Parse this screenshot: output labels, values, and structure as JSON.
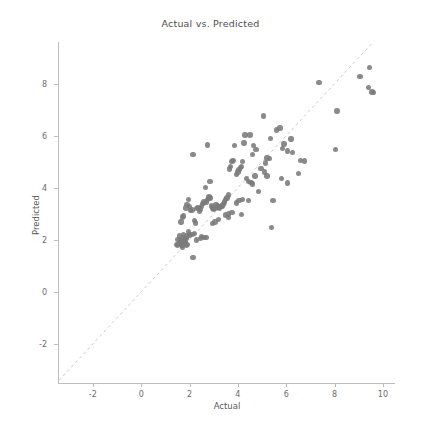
{
  "chart_data": {
    "type": "scatter",
    "title": "Actual vs. Predicted",
    "xlabel": "Actual",
    "ylabel": "Predicted",
    "xlim": [
      -3.4,
      10.5
    ],
    "ylim": [
      -3.5,
      9.6
    ],
    "grid": false,
    "legend": null,
    "marker_color": "#7a7a7a",
    "reference_line": {
      "name": "identity-line",
      "style": "dashed",
      "color": "#cccccc",
      "from": [
        -3.4,
        -3.4
      ],
      "to": [
        9.6,
        9.6
      ]
    },
    "xticks": [
      -2,
      0,
      2,
      4,
      6,
      8,
      10
    ],
    "yticks": [
      -2,
      0,
      2,
      4,
      6,
      8
    ],
    "xticklabels": [
      "-2",
      "0",
      "2",
      "4",
      "6",
      "8",
      "10"
    ],
    "yticklabels": [
      "-2",
      "0",
      "2",
      "4",
      "6",
      "8"
    ],
    "points": [
      [
        9.45,
        8.63
      ],
      [
        9.05,
        8.27
      ],
      [
        9.4,
        7.85
      ],
      [
        9.55,
        7.68
      ],
      [
        9.6,
        7.66
      ],
      [
        7.35,
        8.05
      ],
      [
        8.1,
        6.95
      ],
      [
        8.05,
        5.47
      ],
      [
        6.75,
        5.03
      ],
      [
        6.6,
        5.05
      ],
      [
        6.5,
        4.55
      ],
      [
        6.2,
        5.88
      ],
      [
        6.25,
        5.35
      ],
      [
        6.05,
        5.42
      ],
      [
        6.05,
        4.18
      ],
      [
        5.9,
        5.68
      ],
      [
        5.85,
        5.52
      ],
      [
        5.8,
        4.35
      ],
      [
        5.75,
        6.3
      ],
      [
        5.6,
        6.22
      ],
      [
        5.35,
        5.9
      ],
      [
        5.3,
        5.12
      ],
      [
        5.2,
        5.15
      ],
      [
        5.15,
        4.95
      ],
      [
        5.05,
        6.75
      ],
      [
        5.45,
        3.5
      ],
      [
        5.4,
        2.47
      ],
      [
        5.2,
        4.45
      ],
      [
        5.1,
        4.6
      ],
      [
        4.95,
        4.75
      ],
      [
        4.75,
        5.48
      ],
      [
        4.65,
        5.62
      ],
      [
        4.6,
        5.28
      ],
      [
        4.5,
        6.03
      ],
      [
        4.3,
        6.03
      ],
      [
        4.25,
        5.72
      ],
      [
        4.2,
        5.0
      ],
      [
        4.15,
        4.82
      ],
      [
        4.1,
        4.78
      ],
      [
        4.05,
        4.7
      ],
      [
        4.0,
        4.6
      ],
      [
        3.95,
        4.52
      ],
      [
        4.35,
        4.35
      ],
      [
        4.45,
        4.25
      ],
      [
        4.55,
        4.2
      ],
      [
        4.6,
        4.15
      ],
      [
        4.7,
        4.45
      ],
      [
        4.85,
        3.85
      ],
      [
        4.45,
        3.5
      ],
      [
        4.2,
        3.55
      ],
      [
        4.05,
        3.5
      ],
      [
        4.15,
        2.98
      ],
      [
        3.95,
        3.42
      ],
      [
        3.85,
        5.62
      ],
      [
        3.8,
        5.05
      ],
      [
        3.75,
        5.0
      ],
      [
        3.7,
        4.82
      ],
      [
        3.65,
        4.72
      ],
      [
        3.6,
        3.72
      ],
      [
        3.55,
        3.6
      ],
      [
        3.5,
        3.55
      ],
      [
        3.45,
        3.45
      ],
      [
        3.4,
        3.38
      ],
      [
        3.35,
        3.3
      ],
      [
        3.3,
        3.28
      ],
      [
        3.25,
        3.22
      ],
      [
        3.2,
        3.25
      ],
      [
        3.15,
        3.3
      ],
      [
        3.1,
        3.35
      ],
      [
        3.05,
        3.2
      ],
      [
        3.0,
        3.18
      ],
      [
        2.95,
        3.22
      ],
      [
        2.9,
        3.3
      ],
      [
        2.85,
        3.6
      ],
      [
        2.8,
        3.65
      ],
      [
        2.75,
        3.55
      ],
      [
        2.7,
        3.45
      ],
      [
        2.95,
        2.62
      ],
      [
        3.05,
        2.68
      ],
      [
        3.2,
        2.78
      ],
      [
        3.5,
        2.95
      ],
      [
        3.6,
        3.0
      ],
      [
        3.75,
        3.05
      ],
      [
        3.6,
        2.85
      ],
      [
        2.85,
        4.25
      ],
      [
        2.75,
        5.65
      ],
      [
        2.65,
        4.0
      ],
      [
        2.6,
        3.45
      ],
      [
        2.55,
        3.4
      ],
      [
        2.5,
        3.28
      ],
      [
        2.45,
        3.18
      ],
      [
        2.4,
        3.1
      ],
      [
        2.35,
        3.25
      ],
      [
        2.3,
        3.2
      ],
      [
        2.25,
        2.65
      ],
      [
        2.2,
        2.75
      ],
      [
        2.15,
        5.28
      ],
      [
        2.1,
        3.15
      ],
      [
        2.05,
        3.12
      ],
      [
        2.0,
        3.28
      ],
      [
        1.95,
        3.55
      ],
      [
        1.9,
        3.35
      ],
      [
        1.85,
        3.22
      ],
      [
        1.75,
        2.92
      ],
      [
        1.7,
        2.88
      ],
      [
        1.65,
        2.68
      ],
      [
        2.15,
        1.32
      ],
      [
        2.3,
        2.0
      ],
      [
        2.45,
        2.05
      ],
      [
        2.5,
        2.12
      ],
      [
        2.6,
        2.1
      ],
      [
        2.7,
        2.08
      ],
      [
        2.2,
        2.25
      ],
      [
        2.1,
        2.2
      ],
      [
        2.0,
        2.18
      ],
      [
        1.95,
        2.32
      ],
      [
        1.9,
        2.15
      ],
      [
        1.85,
        2.05
      ],
      [
        1.8,
        2.02
      ],
      [
        1.75,
        2.2
      ],
      [
        1.7,
        2.1
      ],
      [
        1.65,
        1.98
      ],
      [
        1.6,
        1.92
      ],
      [
        1.55,
        1.85
      ],
      [
        1.5,
        1.78
      ],
      [
        1.52,
        2.02
      ],
      [
        1.58,
        2.15
      ],
      [
        1.62,
        1.88
      ],
      [
        1.68,
        1.8
      ],
      [
        1.72,
        1.72
      ],
      [
        1.78,
        1.9
      ],
      [
        1.82,
        1.95
      ],
      [
        1.88,
        1.78
      ],
      [
        1.92,
        1.82
      ],
      [
        1.45,
        1.82
      ]
    ]
  }
}
